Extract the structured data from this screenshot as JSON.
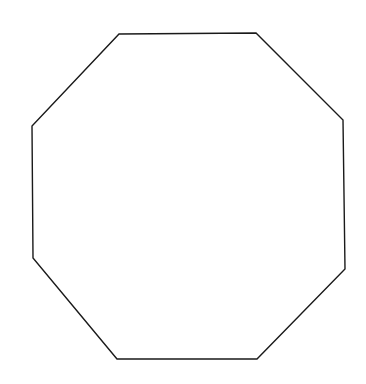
{
  "figure": {
    "shape": "octagon",
    "stroke_color": "#1a1a1a",
    "background_color": "#ffffff",
    "stroke_width": 1.4,
    "vertices": [
      [
        119,
        34
      ],
      [
        256,
        33
      ],
      [
        343,
        120
      ],
      [
        345,
        269
      ],
      [
        257,
        359
      ],
      [
        117,
        359
      ],
      [
        33,
        258
      ],
      [
        32,
        126
      ]
    ]
  }
}
